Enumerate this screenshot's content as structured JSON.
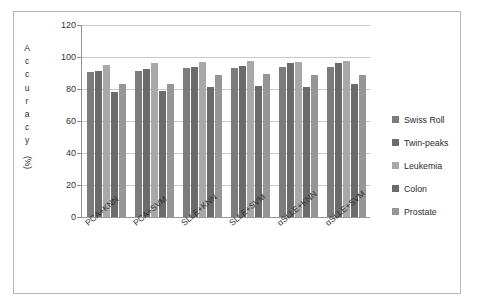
{
  "chart_data": {
    "type": "bar",
    "title": "",
    "subtitle": "",
    "xlabel": "",
    "ylabel": "Accuracy (%)",
    "ylabel_letters": [
      "A",
      "c",
      "c",
      "u",
      "r",
      "a",
      "c",
      "y"
    ],
    "ylabel_suffix": "(%)",
    "ylim": [
      0,
      120
    ],
    "ytick_step": 20,
    "yticks": [
      0,
      20,
      40,
      60,
      80,
      100,
      120
    ],
    "ytick_labels": [
      "0",
      "20",
      "40",
      "60",
      "80",
      "100",
      "120"
    ],
    "grid": true,
    "grid_axis": "y",
    "legend_position": "right",
    "categories": [
      "PCA+KNN",
      "PCA+SVM",
      "SLLE+KNN",
      "SLLE+SVM",
      "αSLLE+KNN",
      "αSLLE+SVM"
    ],
    "series": [
      {
        "name": "Swiss Roll",
        "color": "#7c7c7c",
        "values": [
          90.5,
          91.0,
          93.0,
          93.0,
          93.5,
          94.0
        ]
      },
      {
        "name": "Twin-peaks",
        "color": "#6b6b6b",
        "values": [
          91.5,
          92.5,
          94.0,
          94.5,
          96.0,
          96.0
        ]
      },
      {
        "name": "Leukemia",
        "color": "#a8a8a8",
        "values": [
          95.0,
          96.0,
          97.0,
          97.5,
          97.0,
          97.5
        ]
      },
      {
        "name": "Colon",
        "color": "#6b6b6b",
        "values": [
          78.0,
          78.5,
          81.5,
          82.0,
          81.5,
          83.0
        ]
      },
      {
        "name": "Prostate",
        "color": "#969696",
        "values": [
          83.0,
          83.0,
          88.5,
          89.5,
          88.5,
          89.0
        ]
      }
    ]
  },
  "legend": {
    "items": [
      {
        "label": "Swiss Roll",
        "color": "#7c7c7c"
      },
      {
        "label": "Twin-peaks",
        "color": "#6b6b6b"
      },
      {
        "label": "Leukemia",
        "color": "#a8a8a8"
      },
      {
        "label": "Colon",
        "color": "#6b6b6b"
      },
      {
        "label": "Prostate",
        "color": "#969696"
      }
    ]
  },
  "style": {
    "figure_border": "#b6b6b6",
    "gridline_color": "#c9c9c9",
    "axis_color": "#8f8f8f",
    "background": "#ffffff",
    "text_color": "#2b2b2b"
  }
}
